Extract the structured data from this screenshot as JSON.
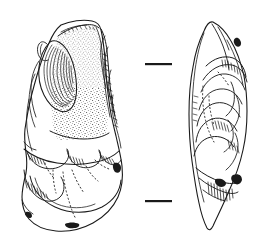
{
  "figure": {
    "kind": "line-drawing",
    "background_color": "#ffffff",
    "ink_color": "#1a1a1a",
    "stipple_color": "#333333",
    "width_px": 258,
    "height_px": 243
  },
  "views": [
    {
      "id": "ventral-face",
      "name": "Broad face view",
      "position": "left",
      "features": [
        "cortex stippled area",
        "large flake scar with ripple lines",
        "retouched right margin",
        "striking platform at base",
        "bulb of percussion"
      ]
    },
    {
      "id": "lateral-profile",
      "name": "Lateral profile view",
      "position": "right",
      "features": [
        "pointed distal tip",
        "stepped flake scars",
        "hachure shading along edge",
        "tapering base"
      ]
    }
  ],
  "scale_marks": [
    {
      "id": "scale-tick-upper",
      "label": "",
      "x": 145,
      "y": 63,
      "length": 27
    },
    {
      "id": "scale-tick-lower",
      "label": "",
      "x": 145,
      "y": 200,
      "length": 27
    }
  ],
  "annotations": {
    "caption": "",
    "scale_label": ""
  }
}
